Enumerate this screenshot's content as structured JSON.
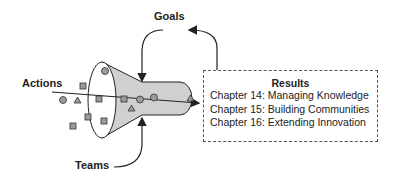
{
  "labels": {
    "goals": "Goals",
    "actions": "Actions",
    "teams": "Teams"
  },
  "results": {
    "title": "Results",
    "items": [
      "Chapter 14: Managing Knowledge",
      "Chapter 15: Building Communities",
      "Chapter 16: Extending Innovation"
    ]
  },
  "colors": {
    "funnel_fill": "#d0d0d0",
    "shape_fill": "#9a9a9a",
    "stroke": "#222222"
  }
}
